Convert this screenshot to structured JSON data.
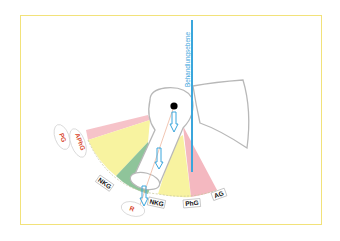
{
  "diagram": {
    "colors": {
      "frame": "#f2e27a",
      "plane": "#3aa6dc",
      "pink": "#f4b8c0",
      "yellow": "#f8f3a0",
      "green": "#8fc49a",
      "bone_outline": "#b8b8b8",
      "red_text": "#d8452a"
    },
    "plane_label": "Behandlungsebene",
    "labels": {
      "pg": "PG",
      "aphg": "APhG",
      "nkg_left": "NKG",
      "r": "R",
      "nkg_bottom": "NKG",
      "phg": "PhG",
      "ag": "AG"
    }
  }
}
